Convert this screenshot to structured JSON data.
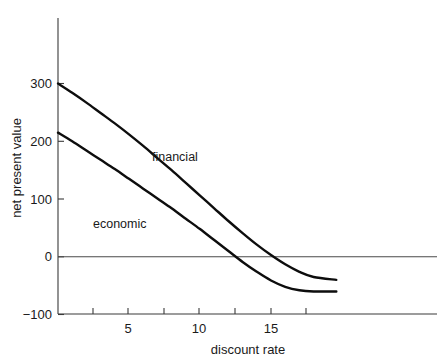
{
  "chart_data": {
    "type": "line",
    "title": "",
    "subtitle": "",
    "xlabel": "discount rate",
    "ylabel": "net present value",
    "xlim": [
      0,
      19.5
    ],
    "ylim": [
      -100,
      340
    ],
    "grid": false,
    "legend_position": "inline-annotations",
    "x_ticks": [
      2.5,
      5,
      7.5,
      10,
      12.5,
      15,
      17.5
    ],
    "x_tick_labels": [
      "",
      "5",
      "",
      "10",
      "",
      "15",
      ""
    ],
    "y_ticks": [
      -100,
      0,
      100,
      200,
      300
    ],
    "y_tick_labels": [
      "−100",
      "0",
      "100",
      "200",
      "300"
    ],
    "zero_reference_line": 0,
    "series": [
      {
        "name": "financial",
        "label": "financial",
        "color": "#0d0d0d",
        "x": [
          0,
          1,
          2,
          3,
          4,
          5,
          6,
          7,
          8,
          9,
          10,
          11,
          12,
          13,
          14,
          15,
          16,
          17,
          18,
          19.6
        ],
        "values": [
          300,
          284,
          267,
          249,
          231,
          212,
          192,
          171,
          150,
          128,
          106,
          84,
          62,
          41,
          21,
          3,
          -13,
          -26,
          -35,
          -40
        ]
      },
      {
        "name": "economic",
        "label": "economic",
        "color": "#0d0d0d",
        "x": [
          0,
          1,
          2,
          3,
          4,
          5,
          6,
          7,
          8,
          9,
          10,
          11,
          12,
          13,
          14,
          15,
          16,
          17,
          18,
          19.6
        ],
        "values": [
          215,
          200,
          184,
          168,
          152,
          135,
          118,
          101,
          84,
          66,
          48,
          29,
          10,
          -9,
          -26,
          -41,
          -52,
          -58,
          -60,
          -60
        ]
      }
    ],
    "annotations": [
      {
        "text": "financial",
        "x": 6.6,
        "y": 152
      },
      {
        "text": "economic",
        "x": 2.4,
        "y": 52
      }
    ]
  }
}
